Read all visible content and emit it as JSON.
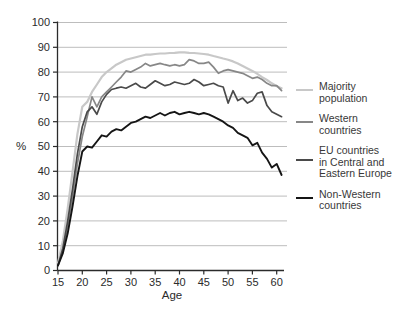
{
  "chart_data": {
    "type": "line",
    "title": "",
    "xlabel": "Age",
    "ylabel": "%",
    "xlim": [
      15,
      62
    ],
    "ylim": [
      0,
      100
    ],
    "x_ticks": [
      15,
      20,
      25,
      30,
      35,
      40,
      45,
      50,
      55,
      60
    ],
    "y_ticks": [
      0,
      10,
      20,
      30,
      40,
      50,
      60,
      70,
      80,
      90,
      100
    ],
    "grid": "horizontal",
    "gridline_color": "#bdbdbd",
    "axis_color": "#2b2b2b",
    "legend_position": "right",
    "x": [
      15,
      16,
      17,
      18,
      19,
      20,
      21,
      22,
      23,
      24,
      25,
      26,
      27,
      28,
      29,
      30,
      31,
      32,
      33,
      34,
      35,
      36,
      37,
      38,
      39,
      40,
      41,
      42,
      43,
      44,
      45,
      46,
      47,
      48,
      49,
      50,
      51,
      52,
      53,
      54,
      55,
      56,
      57,
      58,
      59,
      60,
      61
    ],
    "series": [
      {
        "name": "Majority population",
        "label_lines": [
          "Majority",
          "population"
        ],
        "color": "#c8c8c8",
        "width": 2.2,
        "values": [
          3,
          12,
          25,
          40,
          55,
          66,
          68,
          72,
          75,
          78,
          80,
          81.5,
          83,
          84,
          85,
          85.5,
          86,
          86.5,
          87,
          87,
          87.3,
          87.5,
          87.5,
          87.7,
          87.8,
          88,
          88,
          87.8,
          87.7,
          87.5,
          87.3,
          87,
          86.5,
          86,
          85.5,
          85,
          84.3,
          83.5,
          82.5,
          81.5,
          80.5,
          79.3,
          78,
          76.8,
          75.5,
          74.3,
          73.5
        ]
      },
      {
        "name": "Western countries",
        "label_lines": [
          "Western",
          "countries"
        ],
        "color": "#878787",
        "width": 1.7,
        "values": [
          2,
          8,
          18,
          30,
          43,
          54,
          62,
          70,
          66,
          70,
          72,
          74,
          76,
          78,
          80.5,
          80,
          81,
          82,
          83.5,
          82.5,
          83,
          83.5,
          83,
          82.5,
          83,
          82.5,
          83,
          85,
          84.5,
          83.5,
          83.5,
          84,
          82,
          79.5,
          80.5,
          81,
          80.5,
          80,
          79.5,
          78.5,
          77.5,
          78,
          77,
          75.5,
          74.5,
          74.5,
          72.5
        ]
      },
      {
        "name": "EU countries in Central and Eastern Europe",
        "label_lines": [
          "EU countries",
          "in Central and",
          "Eastern Europe"
        ],
        "color": "#4a4a4a",
        "width": 1.7,
        "values": [
          2,
          9,
          20,
          33,
          47,
          58,
          64,
          66,
          63,
          68,
          71,
          73,
          73.5,
          74,
          73.5,
          74.5,
          75.5,
          74,
          73.5,
          75,
          76.5,
          75.5,
          74.5,
          75,
          76,
          75.5,
          75,
          75.5,
          77,
          76,
          74.5,
          75,
          75.5,
          74.5,
          74,
          67.5,
          72.5,
          68.5,
          69.5,
          67.5,
          68.5,
          71.5,
          72,
          66.5,
          64,
          63,
          62
        ]
      },
      {
        "name": "Non-Western countries",
        "label_lines": [
          "Non-Western",
          "countries"
        ],
        "color": "#151515",
        "width": 1.9,
        "values": [
          2,
          7,
          15,
          26,
          38,
          48,
          50,
          49.5,
          52,
          54.5,
          54,
          56,
          57,
          56.5,
          58,
          59.5,
          60,
          61,
          62,
          61.5,
          62.5,
          63.5,
          62.5,
          63.5,
          64,
          63,
          63.5,
          64,
          63.5,
          63,
          63.5,
          63,
          62,
          61,
          60,
          58.5,
          57.5,
          55.5,
          54.5,
          53.5,
          50.5,
          51.5,
          47.5,
          45,
          41.5,
          43,
          38.5
        ]
      }
    ]
  }
}
